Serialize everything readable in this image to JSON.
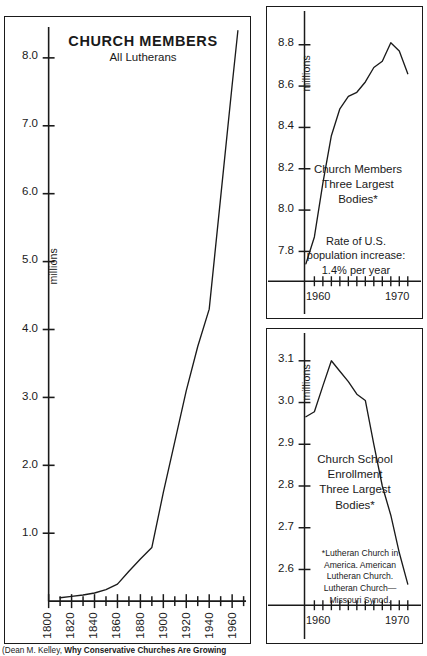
{
  "figure": {
    "source_note_plain": "(Dean M. Kelley, ",
    "source_note_bold": "Why Conservative Churches Are Growing"
  },
  "main_chart": {
    "title_line1": "CHURCH MEMBERS",
    "title_line2": "All Lutherans",
    "units_label": "millions",
    "y_tick_labels": [
      "8.0",
      "7.0",
      "6.0",
      "5.0",
      "4.0",
      "3.0",
      "2.0",
      "1.0"
    ],
    "x_tick_labels": [
      "1800",
      "1820",
      "1840",
      "1860",
      "1880",
      "1900",
      "1920",
      "1940",
      "1960"
    ]
  },
  "top_chart": {
    "caption": "Church Members\nThree Largest\nBodies*",
    "units_label": "millions",
    "note": "Rate of U.S.\npopulation increase:\n1.4% per year",
    "y_tick_labels": [
      "8.8",
      "8.6",
      "8.4",
      "8.2",
      "8.0",
      "7.8"
    ],
    "x_tick_labels": [
      "1960",
      "1970"
    ]
  },
  "bottom_chart": {
    "caption": "Church School\nEnrollment\nThree Largest\nBodies*",
    "units_label": "millions",
    "footnote": "*Lutheran Church in\nAmerica. American\nLutheran Church.\nLutheran Church—\nMissouri Synod.",
    "y_tick_labels": [
      "3.1",
      "3.0",
      "2.9",
      "2.8",
      "2.7",
      "2.6"
    ],
    "x_tick_labels": [
      "1960",
      "1970"
    ]
  },
  "chart_data": [
    {
      "id": "church-members-all-lutherans",
      "type": "line",
      "title": "CHURCH MEMBERS",
      "subtitle": "All Lutherans",
      "xlabel": "",
      "ylabel": "millions",
      "xlim": [
        1800,
        1970
      ],
      "ylim": [
        0,
        8.6
      ],
      "grid": false,
      "legend": "none",
      "x": [
        1810,
        1820,
        1830,
        1840,
        1850,
        1860,
        1870,
        1880,
        1890,
        1900,
        1910,
        1920,
        1930,
        1940,
        1950,
        1960,
        1965
      ],
      "values": [
        0.05,
        0.07,
        0.09,
        0.12,
        0.17,
        0.25,
        0.44,
        0.62,
        0.79,
        1.6,
        2.35,
        3.1,
        3.75,
        4.3,
        5.95,
        7.6,
        8.4
      ]
    },
    {
      "id": "church-members-three-largest-bodies",
      "type": "line",
      "title": "Church Members Three Largest Bodies*",
      "subtitle": "",
      "xlabel": "",
      "ylabel": "millions",
      "xlim": [
        1959,
        1971
      ],
      "ylim": [
        7.7,
        8.9
      ],
      "grid": false,
      "legend": "none",
      "annotation": "Rate of U.S. population increase: 1.4% per year",
      "x": [
        1959,
        1960,
        1961,
        1962,
        1963,
        1964,
        1965,
        1966,
        1967,
        1968,
        1969,
        1970,
        1971
      ],
      "values": [
        7.74,
        7.87,
        8.13,
        8.36,
        8.49,
        8.55,
        8.57,
        8.62,
        8.69,
        8.72,
        8.81,
        8.77,
        8.66
      ]
    },
    {
      "id": "church-school-enrollment-three-largest-bodies",
      "type": "line",
      "title": "Church School Enrollment Three Largest Bodies*",
      "subtitle": "",
      "xlabel": "",
      "ylabel": "millions",
      "xlim": [
        1959,
        1971
      ],
      "ylim": [
        2.55,
        3.15
      ],
      "grid": false,
      "legend": "none",
      "x": [
        1959,
        1960,
        1961,
        1962,
        1963,
        1964,
        1965,
        1966,
        1967,
        1968,
        1969,
        1970,
        1971
      ],
      "values": [
        2.966,
        2.978,
        3.04,
        3.1,
        3.075,
        3.05,
        3.02,
        3.005,
        2.9,
        2.8,
        2.73,
        2.64,
        2.565
      ]
    }
  ]
}
